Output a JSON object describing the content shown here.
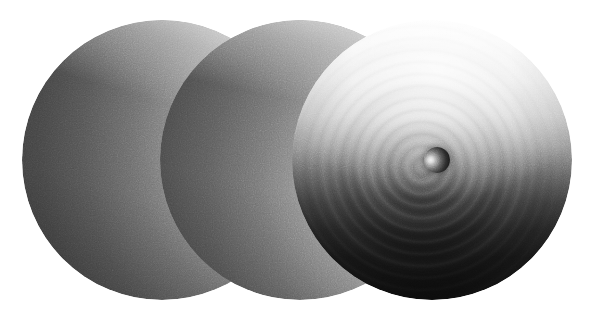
{
  "figure": {
    "background_color": "#ffffff",
    "width": 605,
    "height": 318,
    "colorspace": "grayscale"
  },
  "chart_data": {
    "type": "heatmap",
    "title": "",
    "subtitle": "",
    "xlabel": "",
    "ylabel": "",
    "grid": false,
    "legend_position": "none",
    "panels": [
      {
        "index": 1,
        "label": "",
        "center_x": 162,
        "center_y": 160,
        "radius": 140,
        "shading": "smooth-directional",
        "highlight_position": "right",
        "highlight_x": 320,
        "highlight_y": 122,
        "min_gray": 0.22,
        "max_gray": 1.0,
        "rings": false,
        "inner_sphere": false
      },
      {
        "index": 2,
        "label": "",
        "center_x": 300,
        "center_y": 160,
        "radius": 140,
        "shading": "smooth-directional",
        "highlight_position": "lower-right",
        "highlight_x": 452,
        "highlight_y": 247,
        "min_gray": 0.25,
        "max_gray": 1.0,
        "rings": false,
        "inner_sphere": false
      },
      {
        "index": 3,
        "label": "",
        "center_x": 432,
        "center_y": 160,
        "radius": 140,
        "shading": "wavefront",
        "highlight_position": "top",
        "highlight_x": 432,
        "highlight_y": 45,
        "min_gray": 0.08,
        "max_gray": 1.0,
        "rings": true,
        "ring_count": 12,
        "ring_spacing_px": 12,
        "ring_origin_x": 437,
        "ring_origin_y": 160,
        "inner_sphere": true,
        "inner_sphere_center_x": 437,
        "inner_sphere_center_y": 160,
        "inner_sphere_radius": 13,
        "inner_sphere_highlight": "left"
      }
    ]
  },
  "colors": {
    "background": "#ffffff",
    "sphere_light": "#ffffff",
    "sphere_mid": "#8f8f8f",
    "sphere_dark": "#3b3b3b",
    "panel3_dark": "#191919",
    "inner_sphere_dark": "#0d0d0d",
    "inner_sphere_light": "#f2f2f2"
  },
  "annotations": [],
  "captions": []
}
